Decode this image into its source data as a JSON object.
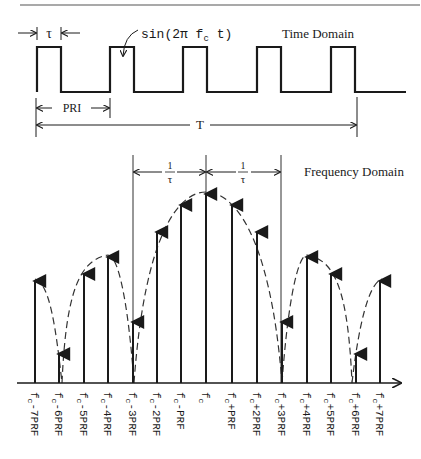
{
  "time_domain": {
    "title": "Time Domain",
    "pulse_width_label": "τ",
    "carrier_label": "sin(2π f",
    "carrier_subscript": "c",
    "carrier_suffix": " t)",
    "pri_label": "PRI",
    "period_label": "T",
    "pulse_starts_px": [
      37,
      110,
      183,
      257,
      331
    ],
    "pulse_width_px": 24
  },
  "frequency_domain": {
    "title": "Frequency Domain",
    "interval_label_num": "1",
    "interval_label_den": "τ",
    "lines": [
      {
        "label": "-7PRF",
        "x": 35,
        "top": 279
      },
      {
        "label": "-6PRF",
        "x": 59,
        "top": 352
      },
      {
        "label": "-5PRF",
        "x": 84,
        "top": 272
      },
      {
        "label": "-4PRF",
        "x": 108,
        "top": 255
      },
      {
        "label": "-3PRF",
        "x": 133,
        "top": 320
      },
      {
        "label": "-2PRF",
        "x": 157,
        "top": 230
      },
      {
        "label": "-PRF",
        "x": 181,
        "top": 203
      },
      {
        "label": "",
        "x": 206,
        "top": 192
      },
      {
        "label": "+PRF",
        "x": 232,
        "top": 203
      },
      {
        "label": "+2PRF",
        "x": 257,
        "top": 230
      },
      {
        "label": "+3PRF",
        "x": 282,
        "top": 320
      },
      {
        "label": "+4PRF",
        "x": 307,
        "top": 255
      },
      {
        "label": "+5PRF",
        "x": 331,
        "top": 272
      },
      {
        "label": "+6PRF",
        "x": 356,
        "top": 352
      },
      {
        "label": "+7PRF",
        "x": 380,
        "top": 279
      }
    ],
    "label_prefix": "f",
    "label_subscript": "c"
  }
}
